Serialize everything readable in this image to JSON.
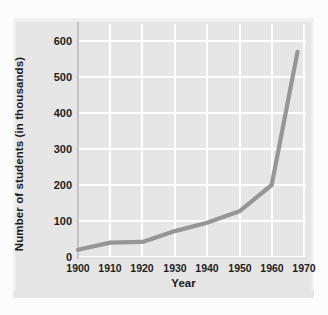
{
  "chart_data": {
    "type": "line",
    "title": "",
    "subtitle": "",
    "xlabel": "Year",
    "ylabel": "Number of students (in thousands)",
    "x": [
      1900,
      1910,
      1920,
      1930,
      1940,
      1950,
      1960,
      1968
    ],
    "values": [
      20,
      40,
      42,
      72,
      95,
      127,
      200,
      570
    ],
    "series": [
      {
        "name": "Number of students",
        "values": [
          20,
          40,
          42,
          72,
          95,
          127,
          200,
          570
        ]
      }
    ],
    "xticks": [
      1900,
      1910,
      1920,
      1930,
      1940,
      1950,
      1960,
      1970
    ],
    "xtick_labels": [
      "1900",
      "1910",
      "1920",
      "1930",
      "1940",
      "1950",
      "1960",
      "1970"
    ],
    "yticks": [
      0,
      100,
      200,
      300,
      400,
      500,
      600
    ],
    "ytick_labels": [
      "0",
      "100",
      "200",
      "300",
      "400",
      "500",
      "600"
    ],
    "xlim": [
      1900,
      1970
    ],
    "ylim": [
      0,
      620
    ],
    "grid": true,
    "grid_color": "#ffffff",
    "legend": "none",
    "line_color": "#969696",
    "panel_color": "#e6e6e6",
    "markers": "none",
    "annotations": []
  }
}
